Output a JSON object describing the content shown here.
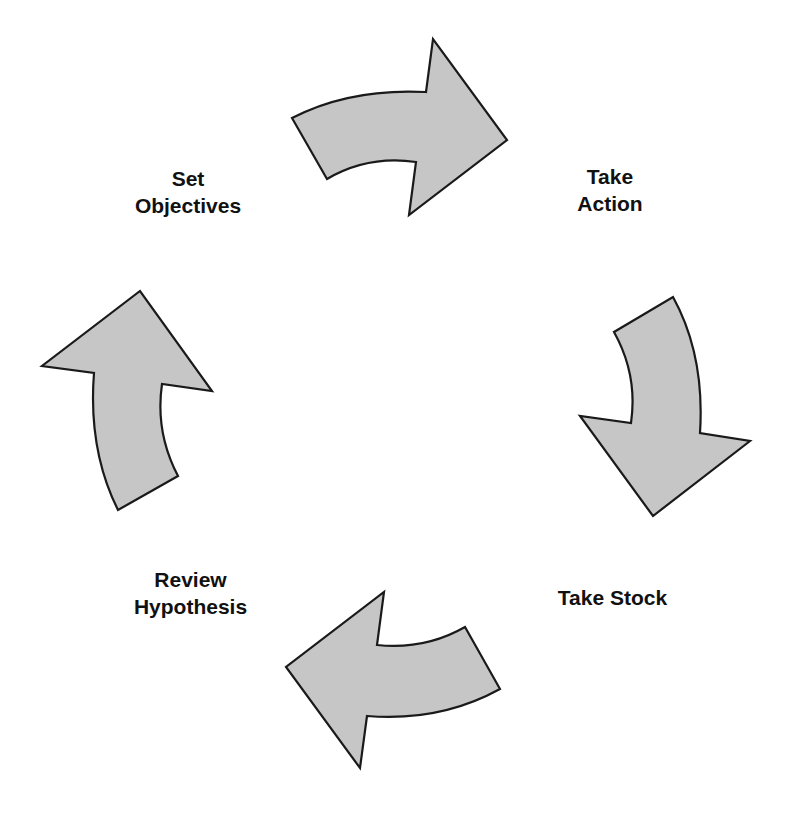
{
  "diagram": {
    "type": "cycle",
    "fill_color": "#c6c6c6",
    "stroke_color": "#1a1a1a",
    "steps": [
      {
        "id": "set-objectives",
        "lines": [
          "Set",
          "Objectives"
        ]
      },
      {
        "id": "take-action",
        "lines": [
          "Take",
          "Action"
        ]
      },
      {
        "id": "take-stock",
        "lines": [
          "Take Stock"
        ]
      },
      {
        "id": "review-hypothesis",
        "lines": [
          "Review",
          "Hypothesis"
        ]
      }
    ],
    "arrows": [
      {
        "id": "arrow-top",
        "direction": "right",
        "from": "Set Objectives",
        "to": "Take Action"
      },
      {
        "id": "arrow-right",
        "direction": "down",
        "from": "Take Action",
        "to": "Take Stock"
      },
      {
        "id": "arrow-bottom",
        "direction": "left",
        "from": "Take Stock",
        "to": "Review Hypothesis"
      },
      {
        "id": "arrow-left",
        "direction": "up",
        "from": "Review Hypothesis",
        "to": "Set Objectives"
      }
    ]
  }
}
